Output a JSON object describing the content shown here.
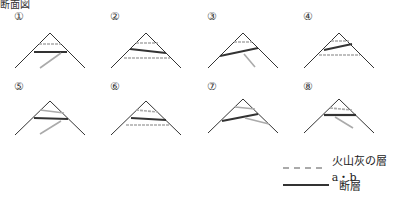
{
  "header": {
    "title": "断面図"
  },
  "panels": [
    {
      "label": "①",
      "x": 4,
      "y": 8
    },
    {
      "label": "②",
      "x": 100,
      "y": 8
    },
    {
      "label": "③",
      "x": 197,
      "y": 8
    },
    {
      "label": "④",
      "x": 293,
      "y": 8
    },
    {
      "label": "⑤",
      "x": 4,
      "y": 80
    },
    {
      "label": "⑥",
      "x": 100,
      "y": 80
    },
    {
      "label": "⑦",
      "x": 197,
      "y": 80
    },
    {
      "label": "⑧",
      "x": 293,
      "y": 80
    }
  ],
  "legend": {
    "ash_layer": "火山灰の層 a・b",
    "fault": "断層"
  },
  "colors": {
    "ash": "#aaaaaa",
    "fault": "#333333",
    "mountain": "#333333"
  }
}
